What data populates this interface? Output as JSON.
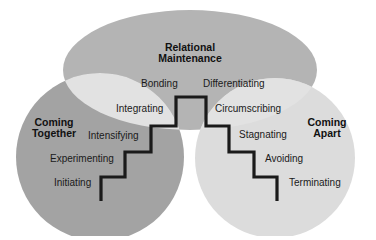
{
  "diagram": {
    "regions": {
      "top": {
        "label_line1": "Relational",
        "label_line2": "Maintenance",
        "color": "#b4b4b4"
      },
      "left": {
        "label_line1": "Coming",
        "label_line2": "Together",
        "color": "#a3a3a3"
      },
      "right": {
        "label_line1": "Coming",
        "label_line2": "Apart",
        "color": "#dcdcdc"
      },
      "overlap_color": "#e2e2e2",
      "staircase_color": "#1a1a1a"
    },
    "coming_together_stages": [
      "Initiating",
      "Experimenting",
      "Intensifying",
      "Integrating",
      "Bonding"
    ],
    "coming_apart_stages": [
      "Differentiating",
      "Circumscribing",
      "Stagnating",
      "Avoiding",
      "Terminating"
    ]
  }
}
